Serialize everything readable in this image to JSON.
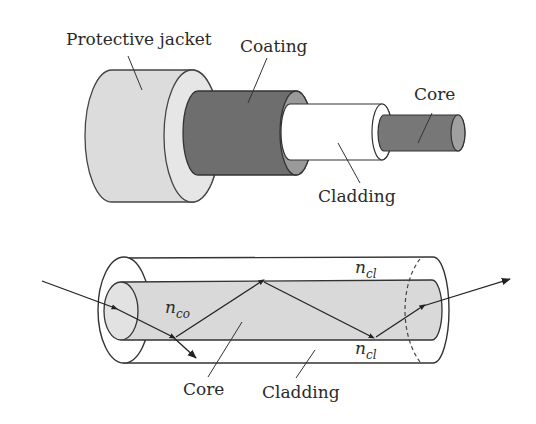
{
  "top_diagram": {
    "title": "Optical fiber layered structure",
    "labels": {
      "jacket": "Protective jacket",
      "coating": "Coating",
      "core": "Core",
      "cladding": "Cladding"
    }
  },
  "bottom_diagram": {
    "title": "Light propagation by total internal reflection",
    "labels": {
      "core": "Core",
      "cladding": "Cladding",
      "n_core_base": "n",
      "n_core_sub": "co",
      "n_clad_top_base": "n",
      "n_clad_top_sub": "cl",
      "n_clad_bottom_base": "n",
      "n_clad_bottom_sub": "cl"
    }
  },
  "colors": {
    "jacket_fill": "#dcdcdc",
    "coating_fill": "#6e6e6e",
    "coating_ring": "#9a9a9a",
    "cladding_fill": "#ffffff",
    "core_fill": "#777777",
    "core_end": "#a0a0a0",
    "core_tube_fill": "#d9d9d9",
    "stroke": "#333333"
  }
}
